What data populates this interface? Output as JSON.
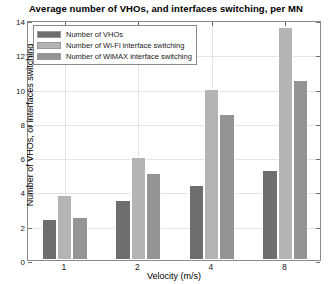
{
  "chart_data": {
    "type": "bar",
    "title": "Average number of VHOs, and interfaces switching, per MN",
    "xlabel": "Velocity (m/s)",
    "ylabel": "Number of VHOs, or interfaces switching",
    "categories": [
      "1",
      "2",
      "4",
      "8"
    ],
    "series": [
      {
        "name": "Number of VHOs",
        "color": "#6e6e6e",
        "values": [
          2.4,
          3.5,
          4.4,
          5.25
        ]
      },
      {
        "name": "Number of Wi-Fi interface switching",
        "color": "#b4b4b4",
        "values": [
          3.8,
          6.0,
          10.0,
          13.6
        ]
      },
      {
        "name": "Number of WiMAX interface switching",
        "color": "#949494",
        "values": [
          2.5,
          5.05,
          8.5,
          10.5
        ]
      }
    ],
    "ylim": [
      0,
      14
    ],
    "yticks": [
      0,
      2,
      4,
      6,
      8,
      10,
      12,
      14
    ],
    "ytick_labels": [
      "0",
      "2",
      "4",
      "6",
      "8",
      "10",
      "12",
      "14"
    ],
    "grid": true,
    "legend_position": "upper-left",
    "axes_color": "#8a8a8a",
    "grid_color": "#e4e4e4",
    "background": "#ffffff"
  }
}
